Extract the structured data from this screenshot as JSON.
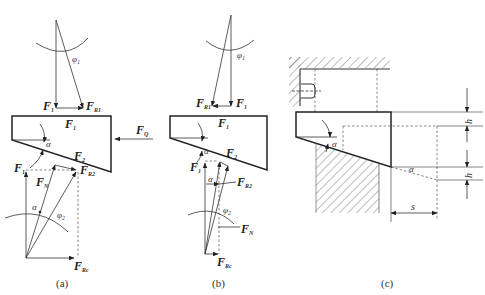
{
  "figure": {
    "panels": [
      {
        "id": "a",
        "caption": "(a)",
        "labels": {
          "F1_top": "F",
          "F1_top_sub": "1",
          "FR1": "F",
          "FR1_sub": "R1",
          "phi1": "φ",
          "phi1_sub": "1",
          "F1_block": "F",
          "F1_block_sub": "1",
          "FQ": "F",
          "FQ_sub": "Q",
          "alpha": "α",
          "F2": "F",
          "F2_sub": "2",
          "F1_low": "F",
          "F1_low_sub": "1",
          "FN": "F",
          "FN_sub": "N",
          "FR2": "F",
          "FR2_sub": "R2",
          "alpha2": "α",
          "phi2": "φ",
          "phi2_sub": "2",
          "FRc": "F",
          "FRc_sub": "Rc"
        }
      },
      {
        "id": "b",
        "caption": "(b)",
        "labels": {
          "phi1": "φ",
          "phi1_sub": "1",
          "FR1": "F",
          "FR1_sub": "R1",
          "F1_top": "F",
          "F1_top_sub": "1",
          "F1_block": "F",
          "F1_block_sub": "1",
          "alpha": "α",
          "F2": "F",
          "F2_sub": "2",
          "F1_low": "F",
          "F1_low_sub": "1",
          "alpha2": "α",
          "FR2": "F",
          "FR2_sub": "R2",
          "phi2": "φ",
          "phi2_sub": "2",
          "FN": "F",
          "FN_sub": "N",
          "FRc": "F",
          "FRc_sub": "Rc"
        }
      },
      {
        "id": "c",
        "caption": "(c)",
        "labels": {
          "h_top": "h",
          "h_bottom": "h",
          "alpha": "α",
          "alpha2": "α",
          "s": "s"
        }
      }
    ]
  }
}
